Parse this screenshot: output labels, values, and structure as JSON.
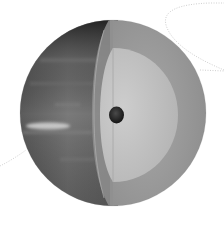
{
  "illustration": {
    "subject": "planet-interior-cutaway",
    "description": "Grayscale cutaway illustration of a gas giant planet showing banded atmosphere on the left hemisphere and interior layers (outer layer, mantle, rocky core) on the right cut face",
    "layers": [
      {
        "name": "atmosphere-surface",
        "color": "#6e6e6e"
      },
      {
        "name": "outer-layer",
        "color": "#9c9c9c"
      },
      {
        "name": "mantle",
        "color": "#c4c4c4"
      },
      {
        "name": "core",
        "color": "#2a2a2a"
      }
    ],
    "background": "#ffffff",
    "orbit_line_color": "#c8c8c8"
  }
}
